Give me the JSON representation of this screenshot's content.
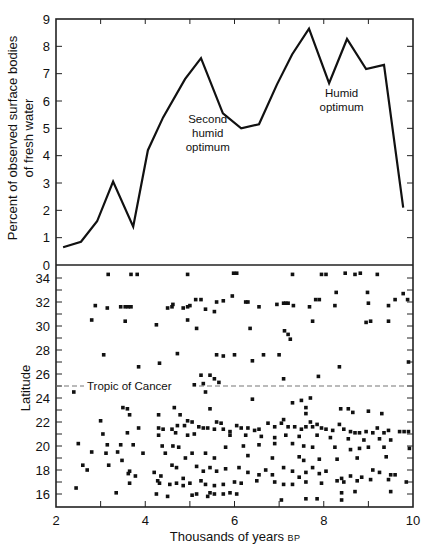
{
  "chart_data": [
    {
      "id": "fresh_water",
      "type": "line",
      "title": "",
      "xlabel": "Thousands of years BP",
      "ylabel": "Percent of observed surface bodies of fresh water",
      "ylabel_lines": [
        "Percent of observed surface bodies",
        "of fresh water"
      ],
      "xlim": [
        2,
        10
      ],
      "ylim": [
        0,
        9
      ],
      "yticks": [
        0,
        1,
        2,
        3,
        4,
        5,
        6,
        7,
        8,
        9
      ],
      "xticks": [
        2,
        3,
        4,
        5,
        6,
        7,
        8,
        9,
        10
      ],
      "grid": false,
      "x": [
        2.16,
        2.56,
        2.92,
        3.28,
        3.73,
        4.06,
        4.4,
        4.89,
        5.25,
        5.74,
        6.15,
        6.55,
        6.95,
        7.29,
        7.67,
        8.12,
        8.52,
        8.95,
        9.35,
        9.78
      ],
      "y": [
        0.65,
        0.85,
        1.6,
        3.05,
        1.4,
        4.2,
        5.4,
        6.8,
        7.57,
        5.55,
        5.0,
        5.15,
        6.6,
        7.7,
        8.65,
        6.65,
        8.27,
        7.17,
        7.32,
        2.1
      ],
      "annotations": [
        {
          "lines": [
            "Second",
            "humid",
            "optimum"
          ],
          "x": 5.4,
          "y": 5.2
        },
        {
          "lines": [
            "Humid",
            "optimum"
          ],
          "x": 8.4,
          "y": 6.15
        }
      ]
    },
    {
      "id": "latitude_scatter",
      "type": "scatter",
      "title": "",
      "xlabel": "Thousands of years BP",
      "ylabel": "Latitude",
      "xlim": [
        2,
        10
      ],
      "ylim": [
        15,
        35.1
      ],
      "yticks": [
        16,
        18,
        20,
        22,
        24,
        26,
        28,
        30,
        32,
        34
      ],
      "xticks": [
        2,
        4,
        6,
        8,
        10
      ],
      "grid": false,
      "reference_line": {
        "y": 25,
        "label": "Tropic of Cancer",
        "style": "dashed"
      },
      "points": [
        [
          3.17,
          34.3
        ],
        [
          3.68,
          34.3
        ],
        [
          3.82,
          34.3
        ],
        [
          4.95,
          34.3
        ],
        [
          5.98,
          34.4
        ],
        [
          6.05,
          34.4
        ],
        [
          7.3,
          34.3
        ],
        [
          7.95,
          34.3
        ],
        [
          8.05,
          34.3
        ],
        [
          8.48,
          34.4
        ],
        [
          8.7,
          34.3
        ],
        [
          8.82,
          34.4
        ],
        [
          9.2,
          34.3
        ],
        [
          2.88,
          31.7
        ],
        [
          3.15,
          31.5
        ],
        [
          3.45,
          31.6
        ],
        [
          3.55,
          31.6
        ],
        [
          3.62,
          31.6
        ],
        [
          3.68,
          31.6
        ],
        [
          4.5,
          31.5
        ],
        [
          4.6,
          31.6
        ],
        [
          4.62,
          31.8
        ],
        [
          4.85,
          31.5
        ],
        [
          4.95,
          31.6
        ],
        [
          5.0,
          31.7
        ],
        [
          5.13,
          32.2
        ],
        [
          5.25,
          32.2
        ],
        [
          5.35,
          31.4
        ],
        [
          5.55,
          31.2
        ],
        [
          5.6,
          32.0
        ],
        [
          5.75,
          32.1
        ],
        [
          5.95,
          32.5
        ],
        [
          6.25,
          32.0
        ],
        [
          6.3,
          32.0
        ],
        [
          6.55,
          31.6
        ],
        [
          6.95,
          31.8
        ],
        [
          7.1,
          31.9
        ],
        [
          7.15,
          31.9
        ],
        [
          7.2,
          31.9
        ],
        [
          7.32,
          31.7
        ],
        [
          7.68,
          31.6
        ],
        [
          7.82,
          32.2
        ],
        [
          7.9,
          32.2
        ],
        [
          8.28,
          32.8
        ],
        [
          8.25,
          31.7
        ],
        [
          8.98,
          32.8
        ],
        [
          9.0,
          31.9
        ],
        [
          9.45,
          31.7
        ],
        [
          9.6,
          32.2
        ],
        [
          9.78,
          32.7
        ],
        [
          9.88,
          32.2
        ],
        [
          2.8,
          30.5
        ],
        [
          3.55,
          30.4
        ],
        [
          4.25,
          30.1
        ],
        [
          4.95,
          30.5
        ],
        [
          5.15,
          29.8
        ],
        [
          6.35,
          29.8
        ],
        [
          7.75,
          30.4
        ],
        [
          7.12,
          29.6
        ],
        [
          7.2,
          29.3
        ],
        [
          7.25,
          28.9
        ],
        [
          8.95,
          30.3
        ],
        [
          9.05,
          30.4
        ],
        [
          9.45,
          30.4
        ],
        [
          3.07,
          27.6
        ],
        [
          4.72,
          27.7
        ],
        [
          5.6,
          27.6
        ],
        [
          5.75,
          27.5
        ],
        [
          6.0,
          27.6
        ],
        [
          6.65,
          27.6
        ],
        [
          7.0,
          27.6
        ],
        [
          6.4,
          27.1
        ],
        [
          4.32,
          26.9
        ],
        [
          3.85,
          26.6
        ],
        [
          8.35,
          26.6
        ],
        [
          9.9,
          27.0
        ],
        [
          5.25,
          25.9
        ],
        [
          5.45,
          25.9
        ],
        [
          5.55,
          25.6
        ],
        [
          5.65,
          25.3
        ],
        [
          7.1,
          25.6
        ],
        [
          7.88,
          25.8
        ],
        [
          2.4,
          24.5
        ],
        [
          5.1,
          25.1
        ],
        [
          5.3,
          25.2
        ],
        [
          5.35,
          24.5
        ],
        [
          3.5,
          23.2
        ],
        [
          3.6,
          23.1
        ],
        [
          3.65,
          22.6
        ],
        [
          4.65,
          23.2
        ],
        [
          4.78,
          22.6
        ],
        [
          4.3,
          22.6
        ],
        [
          5.45,
          23.1
        ],
        [
          6.4,
          23.9
        ],
        [
          7.3,
          23.6
        ],
        [
          7.5,
          23.8
        ],
        [
          7.7,
          24.0
        ],
        [
          7.6,
          23.2
        ],
        [
          7.6,
          22.7
        ],
        [
          8.38,
          23.1
        ],
        [
          8.55,
          23.1
        ],
        [
          8.65,
          22.8
        ],
        [
          9.0,
          22.9
        ],
        [
          9.3,
          22.7
        ],
        [
          3.0,
          22.1
        ],
        [
          3.6,
          21.1
        ],
        [
          3.85,
          21.5
        ],
        [
          4.3,
          21.5
        ],
        [
          4.4,
          21.4
        ],
        [
          4.6,
          21.4
        ],
        [
          4.68,
          21.1
        ],
        [
          4.72,
          21.7
        ],
        [
          4.88,
          21.7
        ],
        [
          4.95,
          22.1
        ],
        [
          5.05,
          22.0
        ],
        [
          5.2,
          21.6
        ],
        [
          5.3,
          21.5
        ],
        [
          5.4,
          21.5
        ],
        [
          5.55,
          21.4
        ],
        [
          5.6,
          22.0
        ],
        [
          5.7,
          21.9
        ],
        [
          5.75,
          21.4
        ],
        [
          5.9,
          21.2
        ],
        [
          6.05,
          21.7
        ],
        [
          6.15,
          21.5
        ],
        [
          6.3,
          21.5
        ],
        [
          6.45,
          21.3
        ],
        [
          6.55,
          21.4
        ],
        [
          6.75,
          21.9
        ],
        [
          6.9,
          21.6
        ],
        [
          7.05,
          21.9
        ],
        [
          7.1,
          22.2
        ],
        [
          7.2,
          21.6
        ],
        [
          7.35,
          21.6
        ],
        [
          7.5,
          21.4
        ],
        [
          7.6,
          21.6
        ],
        [
          7.7,
          22.0
        ],
        [
          7.75,
          21.6
        ],
        [
          7.85,
          21.8
        ],
        [
          7.95,
          21.5
        ],
        [
          8.05,
          21.4
        ],
        [
          8.2,
          21.3
        ],
        [
          8.35,
          21.8
        ],
        [
          8.45,
          21.4
        ],
        [
          8.6,
          21.2
        ],
        [
          8.7,
          21.1
        ],
        [
          8.8,
          21.1
        ],
        [
          8.95,
          21.2
        ],
        [
          9.1,
          21.1
        ],
        [
          9.2,
          21.5
        ],
        [
          9.35,
          21.1
        ],
        [
          9.45,
          21.3
        ],
        [
          9.7,
          21.2
        ],
        [
          9.8,
          21.2
        ],
        [
          9.9,
          21.2
        ],
        [
          3.05,
          21.0
        ],
        [
          4.3,
          20.9
        ],
        [
          4.95,
          20.9
        ],
        [
          5.1,
          21.0
        ],
        [
          5.9,
          20.9
        ],
        [
          6.25,
          20.9
        ],
        [
          6.6,
          20.8
        ],
        [
          6.9,
          20.7
        ],
        [
          7.15,
          20.9
        ],
        [
          7.45,
          20.8
        ],
        [
          7.85,
          20.9
        ],
        [
          8.15,
          20.7
        ],
        [
          8.55,
          20.6
        ],
        [
          8.9,
          20.5
        ],
        [
          9.25,
          20.6
        ],
        [
          9.5,
          20.5
        ],
        [
          2.5,
          20.2
        ],
        [
          3.15,
          20.1
        ],
        [
          3.45,
          20.1
        ],
        [
          3.73,
          20.1
        ],
        [
          4.38,
          20.0
        ],
        [
          4.62,
          20.0
        ],
        [
          4.75,
          19.9
        ],
        [
          5.8,
          19.9
        ],
        [
          6.2,
          20.0
        ],
        [
          6.55,
          20.1
        ],
        [
          6.9,
          20.2
        ],
        [
          7.3,
          20.2
        ],
        [
          7.55,
          20.0
        ],
        [
          7.75,
          19.9
        ],
        [
          8.25,
          19.9
        ],
        [
          8.6,
          19.7
        ],
        [
          8.8,
          19.8
        ],
        [
          9.0,
          19.9
        ],
        [
          9.35,
          19.9
        ],
        [
          9.92,
          19.8
        ],
        [
          2.8,
          19.5
        ],
        [
          3.12,
          19.4
        ],
        [
          3.38,
          19.5
        ],
        [
          3.95,
          19.4
        ],
        [
          4.45,
          19.4
        ],
        [
          4.9,
          19.0
        ],
        [
          5.05,
          19.4
        ],
        [
          5.35,
          19.4
        ],
        [
          5.55,
          19.0
        ],
        [
          6.3,
          19.2
        ],
        [
          6.85,
          19.0
        ],
        [
          7.45,
          19.1
        ],
        [
          7.55,
          18.8
        ],
        [
          7.9,
          18.9
        ],
        [
          8.3,
          18.9
        ],
        [
          8.75,
          19.0
        ],
        [
          9.4,
          19.1
        ],
        [
          2.6,
          18.4
        ],
        [
          2.7,
          18.0
        ],
        [
          3.18,
          18.4
        ],
        [
          3.48,
          18.8
        ],
        [
          3.78,
          17.5
        ],
        [
          3.62,
          17.7
        ],
        [
          3.65,
          17.9
        ],
        [
          4.2,
          17.8
        ],
        [
          4.35,
          17.5
        ],
        [
          4.6,
          18.4
        ],
        [
          4.7,
          18.2
        ],
        [
          4.85,
          17.3
        ],
        [
          5.15,
          18.3
        ],
        [
          5.3,
          17.9
        ],
        [
          5.45,
          18.2
        ],
        [
          5.6,
          17.9
        ],
        [
          5.8,
          18.1
        ],
        [
          6.1,
          18.2
        ],
        [
          6.3,
          17.8
        ],
        [
          6.55,
          17.6
        ],
        [
          6.7,
          18.0
        ],
        [
          6.85,
          17.6
        ],
        [
          7.1,
          18.2
        ],
        [
          7.3,
          17.9
        ],
        [
          7.45,
          17.4
        ],
        [
          7.6,
          17.8
        ],
        [
          7.75,
          18.2
        ],
        [
          7.9,
          17.7
        ],
        [
          8.05,
          17.9
        ],
        [
          8.4,
          17.3
        ],
        [
          8.6,
          17.5
        ],
        [
          8.85,
          17.4
        ],
        [
          9.1,
          18.0
        ],
        [
          9.25,
          17.8
        ],
        [
          9.5,
          17.6
        ],
        [
          9.6,
          17.6
        ],
        [
          2.45,
          16.5
        ],
        [
          3.35,
          16.1
        ],
        [
          3.65,
          16.9
        ],
        [
          4.28,
          17.1
        ],
        [
          4.32,
          16.9
        ],
        [
          4.55,
          16.8
        ],
        [
          4.7,
          16.9
        ],
        [
          4.85,
          16.7
        ],
        [
          5.0,
          16.9
        ],
        [
          5.25,
          17.1
        ],
        [
          5.35,
          16.8
        ],
        [
          5.55,
          16.7
        ],
        [
          5.75,
          16.8
        ],
        [
          6.0,
          17.0
        ],
        [
          6.15,
          16.9
        ],
        [
          6.5,
          17.1
        ],
        [
          6.9,
          17.0
        ],
        [
          7.1,
          16.8
        ],
        [
          7.3,
          16.8
        ],
        [
          7.6,
          17.0
        ],
        [
          7.95,
          16.9
        ],
        [
          8.3,
          17.1
        ],
        [
          8.45,
          17.0
        ],
        [
          8.75,
          17.1
        ],
        [
          9.05,
          17.2
        ],
        [
          9.45,
          17.2
        ],
        [
          9.85,
          17.0
        ],
        [
          4.25,
          16.0
        ],
        [
          4.5,
          15.8
        ],
        [
          5.05,
          15.9
        ],
        [
          5.15,
          16.0
        ],
        [
          5.4,
          15.8
        ],
        [
          5.45,
          16.1
        ],
        [
          5.55,
          16.0
        ],
        [
          5.75,
          16.0
        ],
        [
          5.9,
          16.1
        ],
        [
          6.05,
          16.0
        ],
        [
          7.05,
          15.5
        ],
        [
          7.6,
          15.6
        ],
        [
          7.85,
          15.6
        ],
        [
          8.4,
          15.5
        ],
        [
          8.4,
          16.1
        ],
        [
          8.7,
          16.2
        ],
        [
          9.5,
          16.2
        ]
      ]
    }
  ]
}
